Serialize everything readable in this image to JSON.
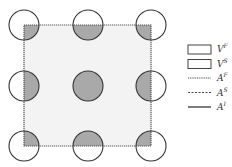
{
  "diagram": {
    "type": "periodic-unit-cell",
    "square": {
      "x": 24,
      "y": 25,
      "size": 127,
      "fill": "#f3f3f3",
      "stroke": "#555555",
      "style": "dotted"
    },
    "circle_radius": 15,
    "circle_fill": "#a9a9a9",
    "circle_stroke": "#333333",
    "circles": [
      {
        "cx": 24,
        "cy": 25,
        "position": "top-left"
      },
      {
        "cx": 88,
        "cy": 25,
        "position": "top-middle"
      },
      {
        "cx": 151,
        "cy": 25,
        "position": "top-right"
      },
      {
        "cx": 24,
        "cy": 86,
        "position": "middle-left"
      },
      {
        "cx": 88,
        "cy": 86,
        "position": "center"
      },
      {
        "cx": 151,
        "cy": 86,
        "position": "middle-right"
      },
      {
        "cx": 24,
        "cy": 146,
        "position": "bottom-left"
      },
      {
        "cx": 88,
        "cy": 146,
        "position": "bottom-middle"
      },
      {
        "cx": 151,
        "cy": 146,
        "position": "bottom-right"
      }
    ]
  },
  "legend": {
    "items": [
      {
        "symbol": "box",
        "base": "V",
        "sup": "F",
        "fill": "#f3f3f3"
      },
      {
        "symbol": "box",
        "base": "V",
        "sup": "S",
        "fill": "#a9a9a9"
      },
      {
        "symbol": "dotted-line",
        "base": "A",
        "sup": "F"
      },
      {
        "symbol": "dashed-line",
        "base": "A",
        "sup": "S"
      },
      {
        "symbol": "solid-line",
        "base": "A",
        "sup": "I"
      }
    ]
  }
}
